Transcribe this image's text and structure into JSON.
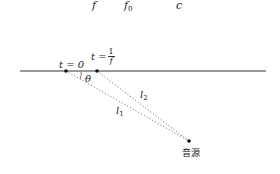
{
  "formula_fragment": {
    "symbols": [
      {
        "name": "f",
        "text": "f",
        "sub": ""
      },
      {
        "name": "f0",
        "text": "f",
        "sub": "0"
      },
      {
        "name": "c",
        "text": "c",
        "sub": ""
      }
    ]
  },
  "diagram": {
    "baseline": {
      "x1": 20,
      "y1": 71,
      "x2": 266,
      "y2": 71
    },
    "points": [
      {
        "id": "p0",
        "x": 66,
        "y": 71
      },
      {
        "id": "p1",
        "x": 97,
        "y": 71
      },
      {
        "id": "source",
        "x": 189,
        "y": 141
      }
    ],
    "labels": {
      "t0": "t = 0",
      "t1_prefix": "t =",
      "t1_num": "1",
      "t1_den": "f",
      "theta": "θ",
      "l1": "l",
      "l1_sub": "1",
      "l2": "l",
      "l2_sub": "2",
      "source": "音源"
    },
    "colors": {
      "line": "#333333",
      "dots": "#111111",
      "dotted": "#555555"
    }
  }
}
